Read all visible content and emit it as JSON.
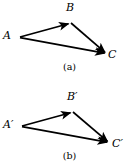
{
  "figure": {
    "background_color": "#ffffff",
    "stroke_color": "#000000",
    "panels": [
      {
        "id": "a",
        "caption": "(a)",
        "vertices": [
          {
            "name": "A",
            "label": "A",
            "x": 20,
            "y": 37
          },
          {
            "name": "B",
            "label": "B",
            "x": 71,
            "y": 23
          },
          {
            "name": "C",
            "label": "C",
            "x": 107,
            "y": 54
          }
        ],
        "arrows": [
          {
            "name": "arrow-a-to-b",
            "from": "A",
            "to": "B"
          },
          {
            "name": "arrow-b-to-c",
            "from": "B",
            "to": "C"
          },
          {
            "name": "arrow-a-to-c",
            "from": "A",
            "to": "C"
          }
        ]
      },
      {
        "id": "b",
        "caption": "(b)",
        "vertices": [
          {
            "name": "A-prime",
            "label": "A′",
            "x": 22,
            "y": 42
          },
          {
            "name": "B-prime",
            "label": "B′",
            "x": 73,
            "y": 28
          },
          {
            "name": "C-prime",
            "label": "C′",
            "x": 110,
            "y": 59
          }
        ],
        "arrows": [
          {
            "name": "arrow-aprime-to-bprime",
            "from": "A-prime",
            "to": "B-prime"
          },
          {
            "name": "arrow-bprime-to-cprime",
            "from": "B-prime",
            "to": "C-prime"
          },
          {
            "name": "arrow-aprime-to-cprime",
            "from": "A-prime",
            "to": "C-prime"
          }
        ]
      }
    ]
  }
}
